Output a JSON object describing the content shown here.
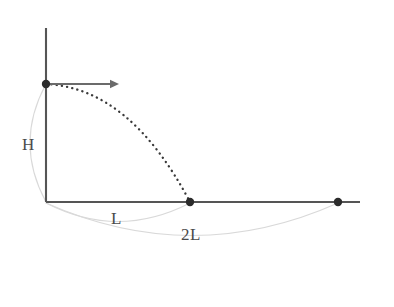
{
  "figure": {
    "background_color": "#ffffff",
    "axis_color": "#555555",
    "trajectory_color": "#3a3a3a",
    "arc_color": "#d9d9d9",
    "label_color": "#4a4a4a",
    "point_color": "#2b2b2b"
  },
  "labels": {
    "height": "H",
    "range_first": "L",
    "range_second": "2L"
  },
  "axes": {
    "origin": {
      "x": 46,
      "y": 202
    },
    "vertical_top": {
      "x": 46,
      "y": 28
    },
    "horizontal_right": {
      "x": 360,
      "y": 202
    }
  },
  "points": [
    {
      "name": "launch-point",
      "x": 46,
      "y": 84,
      "radius": 4.2
    },
    {
      "name": "landing-point",
      "x": 190,
      "y": 202,
      "radius": 4.2
    },
    {
      "name": "far-point",
      "x": 338,
      "y": 202,
      "radius": 4.2
    }
  ],
  "velocity_arrow": {
    "name": "initial-velocity-arrow",
    "start": {
      "x": 49,
      "y": 84
    },
    "end": {
      "x": 119,
      "y": 84
    }
  },
  "trajectory": {
    "name": "projectile-path",
    "style": "dotted",
    "start": {
      "x": 46,
      "y": 84
    },
    "end": {
      "x": 190,
      "y": 202
    },
    "control": {
      "x": 130,
      "y": 88
    }
  },
  "measure_arcs": [
    {
      "name": "height-measure-arc",
      "label": "H",
      "from": {
        "x": 46,
        "y": 84
      },
      "to": {
        "x": 46,
        "y": 202
      },
      "control": {
        "x": 14,
        "y": 143
      }
    },
    {
      "name": "range-L-measure-arc",
      "label": "L",
      "from": {
        "x": 46,
        "y": 203
      },
      "to": {
        "x": 190,
        "y": 203
      },
      "control": {
        "x": 118,
        "y": 240
      }
    },
    {
      "name": "range-2L-measure-arc",
      "label": "2L",
      "from": {
        "x": 46,
        "y": 203
      },
      "to": {
        "x": 338,
        "y": 203
      },
      "control": {
        "x": 192,
        "y": 268
      }
    }
  ],
  "chart_data": {
    "type": "line",
    "xlabel": "",
    "ylabel": "",
    "grid": false,
    "legend": null,
    "annotations": [
      "H",
      "L",
      "2L"
    ],
    "series": [
      {
        "name": "trajectory",
        "style": "dotted",
        "x": [
          0,
          0.25,
          0.5,
          0.75,
          1.0,
          1.25,
          1.5,
          1.75,
          2.0
        ],
        "y": [
          1.0,
          0.984,
          0.938,
          0.859,
          0.75,
          0.609,
          0.438,
          0.234,
          0.0
        ],
        "x_units": "L",
        "y_units": "H"
      }
    ],
    "markers": [
      {
        "label": "launch",
        "x": 0,
        "y": 1.0
      },
      {
        "label": "landing",
        "x": 2.0,
        "y": 0.0
      },
      {
        "label": "far point",
        "x": 4.0,
        "y": 0.0
      }
    ],
    "xlim": [
      0,
      4.35
    ],
    "ylim": [
      0,
      1.47
    ]
  }
}
